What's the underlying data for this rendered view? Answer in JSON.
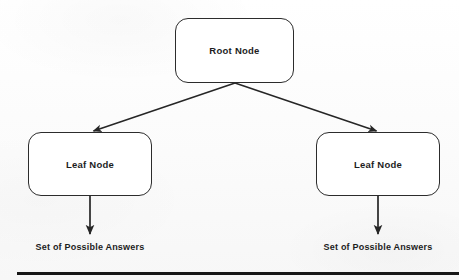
{
  "diagram": {
    "type": "tree",
    "colors": {
      "stroke": "#2c2c2c",
      "text": "#1d1d1d",
      "node_fill": "#ffffff",
      "background": "#fcfcfc",
      "rule": "#171717"
    },
    "nodes": [
      {
        "id": "root",
        "label": "Root Node",
        "shape": "rounded-rectangle",
        "x": 175,
        "y": 18,
        "width": 119,
        "height": 65
      },
      {
        "id": "leaf-left",
        "label": "Leaf Node",
        "shape": "rounded-rectangle",
        "x": 28,
        "y": 132,
        "width": 124,
        "height": 64
      },
      {
        "id": "leaf-right",
        "label": "Leaf Node",
        "shape": "rounded-rectangle",
        "x": 316,
        "y": 132,
        "width": 124,
        "height": 64
      }
    ],
    "edges": [
      {
        "id": "root-to-leaf-left",
        "from": "root",
        "to": "leaf-left",
        "style": "diagonal-arrow",
        "arrowhead": "end"
      },
      {
        "id": "root-to-leaf-right",
        "from": "root",
        "to": "leaf-right",
        "style": "diagonal-arrow",
        "arrowhead": "end"
      },
      {
        "id": "leaf-left-to-answers",
        "from": "leaf-left",
        "to": "answers-left",
        "style": "vertical-arrow",
        "arrowhead": "end"
      },
      {
        "id": "leaf-right-to-answers",
        "from": "leaf-right",
        "to": "answers-right",
        "style": "vertical-arrow",
        "arrowhead": "end"
      }
    ],
    "outcome_labels": [
      {
        "id": "answers-left",
        "text": "Set of Possible Answers"
      },
      {
        "id": "answers-right",
        "text": "Set of Possible Answers"
      }
    ],
    "bottom_rule": {
      "present": true
    }
  }
}
